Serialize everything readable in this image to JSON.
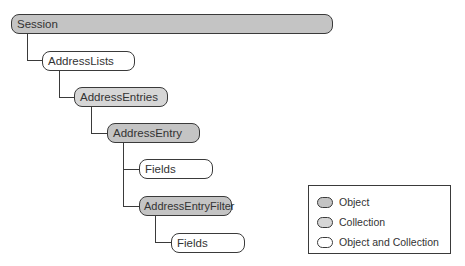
{
  "diagram": {
    "nodes": [
      {
        "id": "session",
        "label": "Session",
        "kind": "object"
      },
      {
        "id": "addresslists",
        "label": "AddressLists",
        "kind": "object-and-collection"
      },
      {
        "id": "addressentries",
        "label": "AddressEntries",
        "kind": "collection"
      },
      {
        "id": "addressentry",
        "label": "AddressEntry",
        "kind": "object"
      },
      {
        "id": "fields1",
        "label": "Fields",
        "kind": "object-and-collection"
      },
      {
        "id": "addressentryfilter",
        "label": "AddressEntryFilter",
        "kind": "object"
      },
      {
        "id": "fields2",
        "label": "Fields",
        "kind": "object-and-collection"
      }
    ],
    "edges": [
      {
        "from": "session",
        "to": "addresslists"
      },
      {
        "from": "addresslists",
        "to": "addressentries"
      },
      {
        "from": "addressentries",
        "to": "addressentry"
      },
      {
        "from": "addressentry",
        "to": "fields1"
      },
      {
        "from": "addressentry",
        "to": "addressentryfilter"
      },
      {
        "from": "addressentryfilter",
        "to": "fields2"
      }
    ]
  },
  "legend": {
    "items": [
      {
        "label": "Object",
        "color": "#c4c4c4"
      },
      {
        "label": "Collection",
        "color": "#d6d6d6"
      },
      {
        "label": "Object and Collection",
        "color": "#ffffff"
      }
    ]
  },
  "colors": {
    "object": "#c4c4c4",
    "collection": "#d6d6d6",
    "object_and_collection": "#ffffff",
    "stroke": "#3a3a3a"
  }
}
